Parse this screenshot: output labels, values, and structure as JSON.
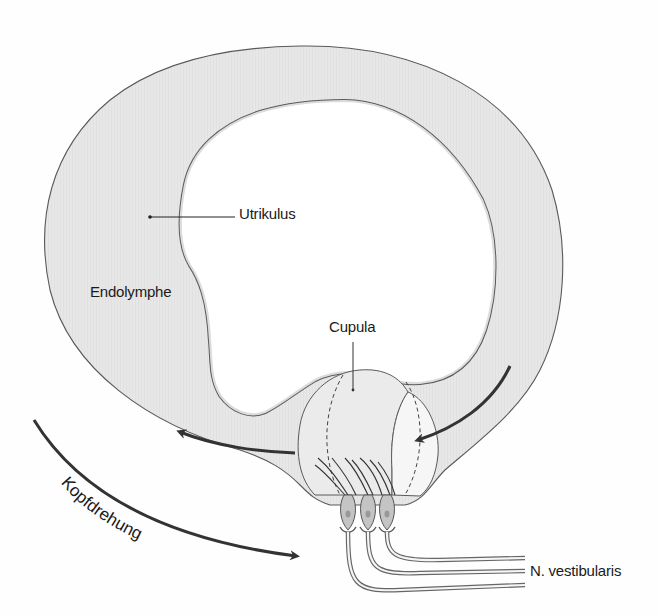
{
  "diagram": {
    "colors": {
      "endolymph_fill": "#e6e6e6",
      "outline": "#555555",
      "arrow": "#333333",
      "cupula_fill": "#ececec",
      "hair_cell_fill": "#bdbdbd",
      "background": "#fefefe"
    }
  },
  "labels": {
    "utrikulus": "Utrikulus",
    "endolymphe": "Endolymphe",
    "cupula": "Cupula",
    "kopfdrehung": "Kopfdrehung",
    "nerve": "N. vestibularis"
  },
  "arrows": [
    {
      "id": "head-rotation",
      "direction": "clockwise-down-right"
    },
    {
      "id": "endolymph-flow-left",
      "direction": "left"
    },
    {
      "id": "endolymph-flow-right",
      "direction": "left-into-cupula"
    }
  ],
  "hair_cells": {
    "count": 3
  }
}
